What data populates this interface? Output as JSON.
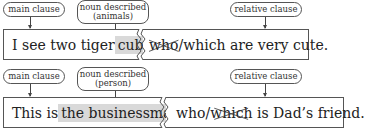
{
  "diagrams": [
    {
      "labels": {
        "main_clause": "main clause",
        "noun_described_line1": "noun described",
        "noun_described_line2": "(animals)",
        "relative_clause": "relative clause"
      },
      "main_part": {
        "before": "I see two tiger",
        "noun": "cubs"
      },
      "relative_part": {
        "crossed_pronoun": "who",
        "slash": "/",
        "kept_pronoun": "which",
        "rest": " are very cute."
      }
    },
    {
      "labels": {
        "main_clause": "main clause",
        "noun_described_line1": "noun described",
        "noun_described_line2": "(person)",
        "relative_clause": "relative clause"
      },
      "main_part": {
        "before": "This is",
        "noun": "the businessman"
      },
      "relative_part": {
        "kept_pronoun": "who",
        "slash": "/",
        "crossed_pronoun": "which",
        "rest": " is Dad’s friend."
      }
    }
  ],
  "colors": {
    "highlight": "#d9d9d9",
    "border": "#555555",
    "text": "#222222"
  }
}
